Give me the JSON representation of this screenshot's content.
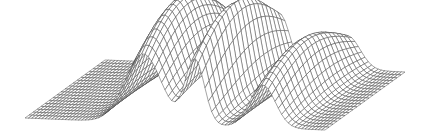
{
  "figure": {
    "type": "3d-wireframe-surface",
    "background": "#ffffff",
    "line_color": "#4a4a4a"
  },
  "mesh": {
    "u_steps": 90,
    "v_steps": 20,
    "u_range": [
      0,
      1
    ],
    "v_range": [
      0,
      1
    ]
  },
  "projection": {
    "origin_front_left": [
      25,
      118
    ],
    "u_axis": [
      300,
      12
    ],
    "v_axis": [
      80,
      -58
    ],
    "height_scale": 1.0
  },
  "peaks": [
    {
      "name": "peak-1",
      "u_center": 0.4,
      "u_width": 0.085,
      "height": 100,
      "skew": 0.6
    },
    {
      "name": "peak-2",
      "u_center": 0.575,
      "u_width": 0.045,
      "height": 95,
      "skew": 0.9
    },
    {
      "name": "peak-3",
      "u_center": 0.8,
      "u_width": 0.06,
      "height": 62,
      "skew": 0.8
    }
  ]
}
